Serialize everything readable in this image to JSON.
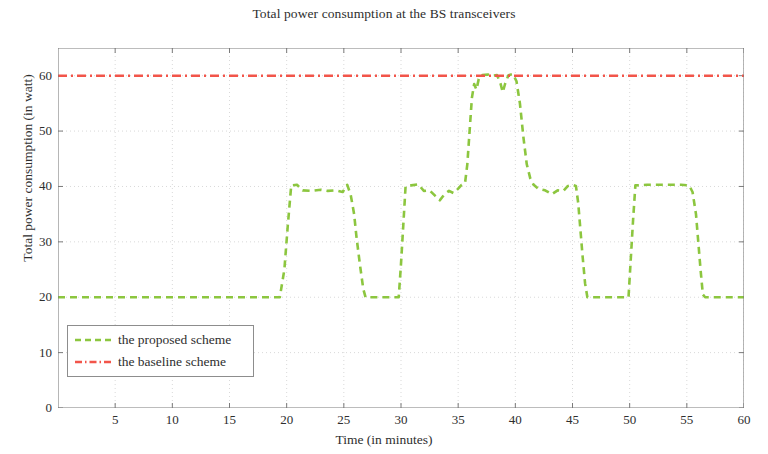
{
  "chart_data": {
    "type": "line",
    "title": "Total power consumption at the BS transceivers",
    "xlabel": "Time (in minutes)",
    "ylabel": "Total power consumption (in watt)",
    "xlim": [
      0,
      60
    ],
    "ylim": [
      0,
      65
    ],
    "xticks": [
      5,
      10,
      15,
      20,
      25,
      30,
      35,
      40,
      45,
      50,
      55,
      60
    ],
    "yticks": [
      0,
      10,
      20,
      30,
      40,
      50,
      60
    ],
    "grid": true,
    "legend_position": "lower left",
    "series": [
      {
        "name": "the proposed scheme",
        "color": "#8cc63f",
        "linestyle": "dashed",
        "points": [
          [
            0.0,
            20.0
          ],
          [
            5.0,
            20.0
          ],
          [
            10.0,
            20.0
          ],
          [
            15.0,
            20.0
          ],
          [
            19.4,
            20.0
          ],
          [
            19.8,
            25.0
          ],
          [
            20.1,
            33.0
          ],
          [
            20.4,
            40.2
          ],
          [
            20.9,
            40.3
          ],
          [
            21.4,
            39.3
          ],
          [
            22.2,
            39.2
          ],
          [
            23.0,
            39.4
          ],
          [
            23.6,
            39.2
          ],
          [
            24.3,
            39.3
          ],
          [
            24.9,
            39.0
          ],
          [
            25.3,
            40.3
          ],
          [
            25.6,
            38.5
          ],
          [
            25.9,
            35.0
          ],
          [
            26.1,
            31.0
          ],
          [
            26.4,
            26.0
          ],
          [
            26.7,
            21.5
          ],
          [
            26.9,
            20.0
          ],
          [
            29.8,
            20.0
          ],
          [
            30.0,
            26.0
          ],
          [
            30.2,
            33.0
          ],
          [
            30.4,
            40.0
          ],
          [
            30.9,
            40.2
          ],
          [
            31.5,
            40.4
          ],
          [
            32.0,
            39.2
          ],
          [
            32.5,
            39.3
          ],
          [
            33.0,
            38.3
          ],
          [
            33.4,
            37.5
          ],
          [
            33.8,
            38.6
          ],
          [
            34.2,
            39.2
          ],
          [
            34.6,
            38.8
          ],
          [
            35.0,
            39.6
          ],
          [
            35.3,
            40.3
          ],
          [
            35.6,
            40.6
          ],
          [
            35.8,
            44.0
          ],
          [
            36.0,
            50.0
          ],
          [
            36.2,
            56.0
          ],
          [
            36.4,
            58.5
          ],
          [
            36.6,
            57.5
          ],
          [
            36.8,
            59.4
          ],
          [
            37.1,
            60.1
          ],
          [
            37.6,
            60.2
          ],
          [
            38.0,
            60.0
          ],
          [
            38.4,
            60.1
          ],
          [
            38.7,
            58.6
          ],
          [
            38.9,
            57.0
          ],
          [
            39.1,
            58.5
          ],
          [
            39.4,
            60.1
          ],
          [
            39.8,
            60.3
          ],
          [
            40.1,
            59.0
          ],
          [
            40.4,
            55.0
          ],
          [
            40.7,
            49.0
          ],
          [
            41.0,
            44.0
          ],
          [
            41.3,
            41.5
          ],
          [
            41.6,
            40.3
          ],
          [
            42.0,
            39.6
          ],
          [
            42.6,
            39.3
          ],
          [
            43.2,
            38.6
          ],
          [
            43.7,
            39.3
          ],
          [
            44.2,
            39.2
          ],
          [
            44.6,
            40.1
          ],
          [
            45.0,
            40.3
          ],
          [
            45.3,
            40.1
          ],
          [
            45.5,
            37.0
          ],
          [
            45.7,
            32.0
          ],
          [
            45.9,
            27.0
          ],
          [
            46.1,
            22.5
          ],
          [
            46.3,
            20.0
          ],
          [
            49.9,
            20.0
          ],
          [
            50.1,
            27.0
          ],
          [
            50.3,
            34.0
          ],
          [
            50.5,
            40.2
          ],
          [
            51.5,
            40.3
          ],
          [
            53.0,
            40.3
          ],
          [
            54.5,
            40.3
          ],
          [
            55.2,
            40.2
          ],
          [
            55.5,
            39.0
          ],
          [
            55.8,
            35.0
          ],
          [
            56.0,
            30.0
          ],
          [
            56.2,
            25.0
          ],
          [
            56.4,
            20.5
          ],
          [
            56.6,
            20.0
          ],
          [
            60.0,
            20.0
          ]
        ]
      },
      {
        "name": "the baseline scheme",
        "color": "#f2554a",
        "linestyle": "dashdot",
        "constant_value": 60.0,
        "points": [
          [
            0.0,
            60.0
          ],
          [
            60.0,
            60.0
          ]
        ]
      }
    ]
  },
  "legend": {
    "items": [
      {
        "label": "the proposed scheme"
      },
      {
        "label": "the baseline scheme"
      }
    ]
  },
  "axes": {
    "title": "Total power consumption at the BS transceivers",
    "xlabel": "Time (in minutes)",
    "ylabel": "Total power consumption (in watt)",
    "xticklabels": [
      "5",
      "10",
      "15",
      "20",
      "25",
      "30",
      "35",
      "40",
      "45",
      "50",
      "55",
      "60"
    ],
    "yticklabels": [
      "0",
      "10",
      "20",
      "30",
      "40",
      "50",
      "60"
    ]
  },
  "colors": {
    "proposed": "#8cc63f",
    "baseline": "#f2554a",
    "grid": "#d9d9d9",
    "axis": "#7a7a7a",
    "text": "#2e2e2e"
  }
}
